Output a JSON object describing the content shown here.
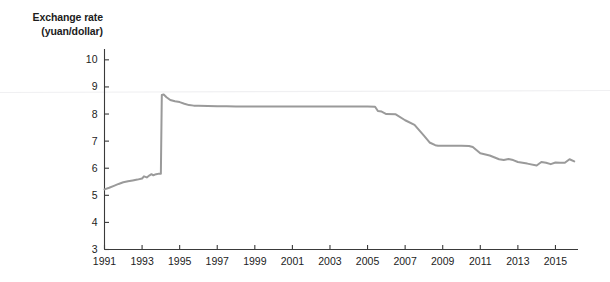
{
  "chart_data": {
    "type": "line",
    "title": "Exchange rate (yuan/dollar)",
    "title_line1": "Exchange rate",
    "title_line2": "(yuan/dollar)",
    "xlabel": "",
    "ylabel": "Exchange rate (yuan/dollar)",
    "xlim": [
      1991,
      2016.2
    ],
    "ylim": [
      3,
      10.4
    ],
    "ytick_labels": [
      "3",
      "4",
      "5",
      "6",
      "7",
      "8",
      "9",
      "10"
    ],
    "ytick_values": [
      3,
      4,
      5,
      6,
      7,
      8,
      9,
      10
    ],
    "xtick_labels": [
      "1991",
      "1993",
      "1995",
      "1997",
      "1999",
      "2001",
      "2003",
      "2005",
      "2007",
      "2009",
      "2011",
      "2013",
      "2015"
    ],
    "xtick_values": [
      1991,
      1993,
      1995,
      1997,
      1999,
      2001,
      2003,
      2005,
      2007,
      2009,
      2011,
      2013,
      2015
    ],
    "grid": false,
    "legend": "none",
    "line_color": "#9a9a9a",
    "axis_color": "#3a3a3a",
    "series": [
      {
        "name": "Exchange rate (yuan/dollar)",
        "x": [
          1991.0,
          1991.25,
          1991.5,
          1991.75,
          1992.0,
          1992.25,
          1992.5,
          1992.75,
          1993.0,
          1993.1,
          1993.25,
          1993.4,
          1993.5,
          1993.6,
          1993.75,
          1993.9,
          1994.0,
          1994.05,
          1994.15,
          1994.3,
          1994.5,
          1994.75,
          1995.0,
          1995.25,
          1995.5,
          1995.75,
          1996.0,
          1996.5,
          1997.0,
          1997.5,
          1998.0,
          1998.5,
          1999.0,
          1999.5,
          2000.0,
          2000.5,
          2001.0,
          2001.5,
          2002.0,
          2002.5,
          2003.0,
          2003.5,
          2004.0,
          2004.5,
          2005.0,
          2005.4,
          2005.55,
          2005.75,
          2006.0,
          2006.5,
          2007.0,
          2007.5,
          2008.0,
          2008.3,
          2008.6,
          2008.75,
          2009.0,
          2009.5,
          2010.0,
          2010.4,
          2010.6,
          2011.0,
          2011.5,
          2012.0,
          2012.25,
          2012.5,
          2012.75,
          2013.0,
          2013.5,
          2014.0,
          2014.25,
          2014.5,
          2014.75,
          2015.0,
          2015.25,
          2015.5,
          2015.75,
          2016.0
        ],
        "y": [
          5.22,
          5.28,
          5.35,
          5.42,
          5.48,
          5.52,
          5.55,
          5.58,
          5.62,
          5.7,
          5.66,
          5.74,
          5.78,
          5.74,
          5.78,
          5.8,
          5.8,
          8.7,
          8.72,
          8.62,
          8.52,
          8.47,
          8.44,
          8.38,
          8.33,
          8.31,
          8.31,
          8.3,
          8.29,
          8.29,
          8.28,
          8.28,
          8.28,
          8.28,
          8.28,
          8.28,
          8.28,
          8.28,
          8.28,
          8.28,
          8.28,
          8.28,
          8.28,
          8.28,
          8.28,
          8.27,
          8.11,
          8.09,
          8.0,
          7.99,
          7.77,
          7.6,
          7.2,
          6.95,
          6.85,
          6.83,
          6.83,
          6.83,
          6.83,
          6.82,
          6.78,
          6.55,
          6.47,
          6.33,
          6.3,
          6.34,
          6.3,
          6.23,
          6.17,
          6.1,
          6.23,
          6.2,
          6.15,
          6.21,
          6.2,
          6.2,
          6.33,
          6.25
        ]
      }
    ]
  }
}
